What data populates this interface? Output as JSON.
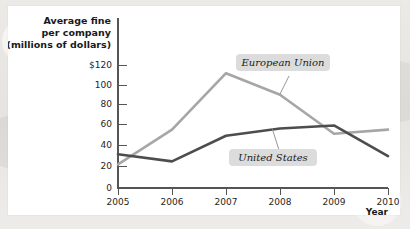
{
  "figure": {
    "background_color": "#ffffff",
    "page_color": "#e9e7e4"
  },
  "chart_data": {
    "type": "line",
    "title": "",
    "ylabel": "Average fine per company (millions of dollars)",
    "ylabel_lines": [
      "Average fine",
      "per company",
      "(millions of dollars)"
    ],
    "xlabel": "Year",
    "categories": [
      "2005",
      "2006",
      "2007",
      "2008",
      "2009",
      "2010"
    ],
    "x": [
      2005,
      2006,
      2007,
      2008,
      2009,
      2010
    ],
    "xlim": [
      2005,
      2010
    ],
    "ylim": [
      0,
      130
    ],
    "ytick_labels": [
      "$120",
      "100",
      "80",
      "60",
      "40",
      "20",
      "0"
    ],
    "ytick_values": [
      120,
      100,
      80,
      60,
      40,
      20,
      0
    ],
    "xtick_labels": [
      "2005",
      "2006",
      "2007",
      "2008",
      "2009",
      "2010"
    ],
    "grid": false,
    "legend_position": "inline-annotations",
    "series": [
      {
        "name": "European Union",
        "color": "#a6a6a6",
        "values": [
          23,
          57,
          112,
          91,
          53,
          57
        ]
      },
      {
        "name": "United States",
        "color": "#4d4d4d",
        "values": [
          33,
          26,
          51,
          58,
          61,
          31
        ]
      }
    ],
    "annotations": [
      {
        "text": "European Union",
        "series": "European Union"
      },
      {
        "text": "United States",
        "series": "United States"
      }
    ]
  }
}
